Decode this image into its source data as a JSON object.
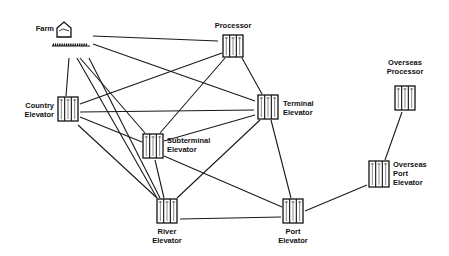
{
  "diagram": {
    "type": "network",
    "nodes": [
      {
        "id": "farm",
        "label_lines": [
          "Farm"
        ],
        "icon": "farm-house-icon"
      },
      {
        "id": "processor",
        "label_lines": [
          "Processor"
        ],
        "icon": "silo-icon"
      },
      {
        "id": "country",
        "label_lines": [
          "Country",
          "Elevator"
        ],
        "icon": "silo-icon"
      },
      {
        "id": "terminal",
        "label_lines": [
          "Terminal",
          "Elevator"
        ],
        "icon": "silo-icon"
      },
      {
        "id": "subterminal",
        "label_lines": [
          "Subterminal",
          "Elevator"
        ],
        "icon": "silo-icon"
      },
      {
        "id": "overseas_processor",
        "label_lines": [
          "Overseas",
          "Processor"
        ],
        "icon": "silo-icon"
      },
      {
        "id": "overseas_port",
        "label_lines": [
          "Overseas",
          "Port",
          "Elevator"
        ],
        "icon": "silo-icon"
      },
      {
        "id": "river",
        "label_lines": [
          "River",
          "Elevator"
        ],
        "icon": "silo-icon"
      },
      {
        "id": "port",
        "label_lines": [
          "Port",
          "Elevator"
        ],
        "icon": "silo-icon"
      }
    ],
    "edges": [
      [
        "farm",
        "processor"
      ],
      [
        "farm",
        "terminal"
      ],
      [
        "farm",
        "country"
      ],
      [
        "farm",
        "subterminal"
      ],
      [
        "farm",
        "river"
      ],
      [
        "farm",
        "river_b"
      ],
      [
        "processor",
        "country"
      ],
      [
        "processor",
        "subterminal"
      ],
      [
        "processor",
        "terminal"
      ],
      [
        "country",
        "terminal"
      ],
      [
        "country",
        "subterminal"
      ],
      [
        "country",
        "river"
      ],
      [
        "subterminal",
        "terminal"
      ],
      [
        "subterminal",
        "river"
      ],
      [
        "subterminal",
        "port"
      ],
      [
        "terminal",
        "river"
      ],
      [
        "terminal",
        "port"
      ],
      [
        "river",
        "port"
      ],
      [
        "port",
        "overseas_port"
      ],
      [
        "overseas_port",
        "overseas_processor"
      ]
    ]
  }
}
